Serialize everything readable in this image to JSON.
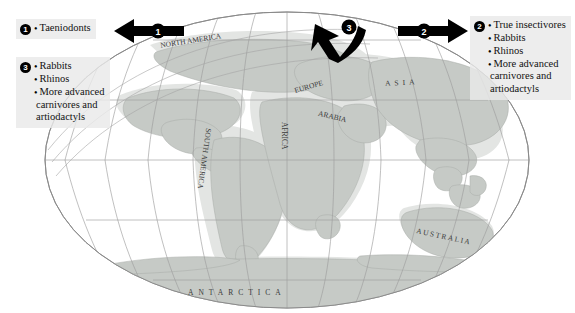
{
  "figure": {
    "type": "paleogeographic-map",
    "projection": "elliptical world map (Mollweide-style)",
    "background": "#ffffff",
    "land_fill": "#c9ccc9",
    "shelf_fill": "#e2e4e2",
    "graticule_color": "#9a9a9a",
    "outline_color": "#777777"
  },
  "callouts": [
    {
      "id": "callout-1",
      "number": "1",
      "items": [
        "Taeniodonts"
      ]
    },
    {
      "id": "callout-3",
      "number": "3",
      "items": [
        "Rabbits",
        "Rhinos",
        "More advanced"
      ],
      "continuation": [
        "carnivores and",
        "artiodactyls"
      ]
    },
    {
      "id": "callout-2",
      "number": "2",
      "items": [
        "True insectivores",
        "Rabbits",
        "Rhinos",
        "More advanced"
      ],
      "continuation": [
        "carnivores and",
        "artiodactyls"
      ]
    }
  ],
  "arrows": [
    {
      "id": "arrow-1",
      "number": "1",
      "direction": "left",
      "color": "#000000"
    },
    {
      "id": "arrow-2",
      "number": "2",
      "direction": "right",
      "color": "#000000"
    },
    {
      "id": "arrow-3",
      "number": "3",
      "direction": "down-left",
      "color": "#000000"
    }
  ],
  "map_labels": [
    {
      "name": "north-america",
      "text": "NORTH AMERICA"
    },
    {
      "name": "south-america",
      "text": "SOUTH AMERICA"
    },
    {
      "name": "africa",
      "text": "AFRICA"
    },
    {
      "name": "arabia",
      "text": "ARABIA"
    },
    {
      "name": "europe",
      "text": "EUROPE"
    },
    {
      "name": "asia",
      "text": "ASIA"
    },
    {
      "name": "australia",
      "text": "AUSTRALIA"
    },
    {
      "name": "antarctica",
      "text": "ANTARCTICA"
    }
  ]
}
